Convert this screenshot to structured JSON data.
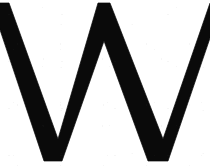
{
  "image": {
    "kind": "glyph-image",
    "subject": "capital-letter-W",
    "character": "W",
    "description": "Black capital letter W on a white background, cropped so the outer strokes meet the left and right edges",
    "width": 210,
    "height": 166,
    "background_color": "#ffffff",
    "ink_color": "#0a0a0a",
    "stroke_style": "straight-diagonal-zigzag",
    "stroke_terminals": "flat-cut",
    "stroke_width_px": 11
  },
  "geometry": {
    "viewbox": "0 0 210 166",
    "top_baseline_y": 3,
    "bottom_baseline_y": 161,
    "peaks": [
      {
        "name": "left-top",
        "x": 4,
        "y": 3,
        "clipped": true
      },
      {
        "name": "middle-top",
        "x": 103,
        "y": 3,
        "clipped": false
      },
      {
        "name": "right-top",
        "x": 205,
        "y": 3,
        "clipped": true
      }
    ],
    "valleys": [
      {
        "name": "left-valley",
        "x": 53,
        "y": 161
      },
      {
        "name": "right-valley",
        "x": 158,
        "y": 161
      }
    ],
    "strokes": [
      {
        "name": "stroke-1-down-left",
        "from": "left-top",
        "to": "left-valley"
      },
      {
        "name": "stroke-2-up-middle",
        "from": "left-valley",
        "to": "middle-top"
      },
      {
        "name": "stroke-3-down-middle",
        "from": "middle-top",
        "to": "right-valley"
      },
      {
        "name": "stroke-4-up-right",
        "from": "right-valley",
        "to": "right-top"
      }
    ],
    "outline_path": "M -9 3 L 9 3 L 58 139 L 98 3 L 110 3 L 163 139 L 210 3 L 222 3 L 168 161 L 148 161 L 104 41 L 62 161 L 44 161 Z"
  }
}
